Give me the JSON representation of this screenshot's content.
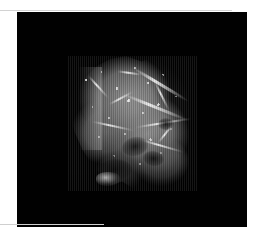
{
  "page": {
    "background_color": "#ffffff",
    "width": 259,
    "height": 249
  },
  "rules": {
    "top": {
      "color": "#d2d2d2"
    },
    "bottom": {
      "color": "#cfcfcf"
    }
  },
  "viewport": {
    "name": "volume-render-viewport",
    "background_color": "#010101",
    "x": 17,
    "y": 12,
    "width": 230,
    "height": 215,
    "overlay_text": ""
  },
  "render": {
    "subject": "volume-rendered-specimen",
    "description": "grayscale 3D volume rendering of a head / skull specimen",
    "colormap": "grayscale",
    "highlight_color": "#f6f6f6",
    "midtone_color": "#8e8e8e",
    "shadow_color": "#2c2c2c",
    "bounds": {
      "x": 68,
      "y": 56,
      "width": 129,
      "height": 135
    },
    "artifacts": "vertical slice striping"
  }
}
